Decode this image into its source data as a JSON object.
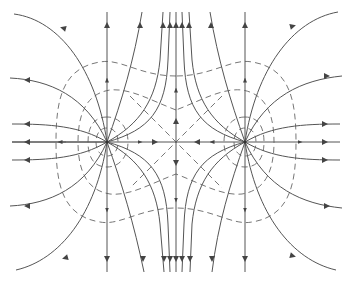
{
  "diagram": {
    "title": "Electric field of two equal positive point charges",
    "charges": [
      {
        "id": "left",
        "x": 107,
        "y": 142,
        "sign": "+"
      },
      {
        "id": "right",
        "x": 245,
        "y": 142,
        "sign": "+"
      }
    ],
    "neutral_point": {
      "x": 176,
      "y": 142
    },
    "colors": {
      "field_line": "#555555",
      "equipotential": "#777777",
      "background": "#ffffff"
    },
    "legend": {
      "field_lines": "solid lines with arrows",
      "equipotentials": "dashed lines"
    }
  }
}
